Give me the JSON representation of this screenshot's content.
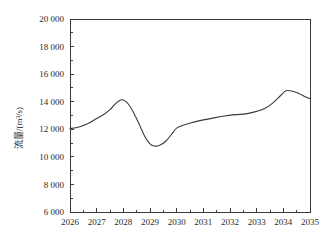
{
  "chart_data": {
    "type": "line",
    "title": "",
    "xlabel": "",
    "ylabel": "流量/(m³/s)",
    "xlim": [
      2026,
      2035
    ],
    "ylim": [
      6000,
      20000
    ],
    "grid": false,
    "legend": null,
    "x_tick_labels": [
      "2026",
      "2027",
      "2028",
      "2029",
      "2030",
      "2031",
      "2032",
      "2033",
      "2034",
      "2035"
    ],
    "x_ticks": [
      2026,
      2027,
      2028,
      2029,
      2030,
      2031,
      2032,
      2033,
      2034,
      2035
    ],
    "y_tick_labels": [
      "6 000",
      "8 000",
      "10 000",
      "12 000",
      "14 000",
      "16 000",
      "18 000",
      "20 000"
    ],
    "y_ticks": [
      6000,
      8000,
      10000,
      12000,
      14000,
      16000,
      18000,
      20000
    ],
    "y_minor_step": 1000,
    "x_minor_step": 0.5,
    "line_color": "#3a3a3a",
    "axis_color": "#3b3b3b",
    "background_color": "#ffffff",
    "series": [
      {
        "name": "流量",
        "x": [
          2026.0,
          2026.25,
          2026.5,
          2026.75,
          2027.0,
          2027.25,
          2027.5,
          2027.7,
          2027.9,
          2028.05,
          2028.2,
          2028.4,
          2028.6,
          2028.8,
          2029.0,
          2029.15,
          2029.35,
          2029.6,
          2029.8,
          2030.0,
          2030.3,
          2030.6,
          2031.0,
          2031.4,
          2031.8,
          2032.2,
          2032.6,
          2033.0,
          2033.3,
          2033.6,
          2033.9,
          2034.1,
          2034.35,
          2034.6,
          2034.8,
          2035.0
        ],
        "values": [
          12050,
          12130,
          12280,
          12500,
          12780,
          13050,
          13420,
          13850,
          14130,
          14080,
          13800,
          13150,
          12350,
          11500,
          10950,
          10790,
          10830,
          11150,
          11620,
          12080,
          12330,
          12500,
          12680,
          12830,
          12960,
          13060,
          13120,
          13300,
          13500,
          13900,
          14450,
          14800,
          14760,
          14580,
          14380,
          14220
        ]
      }
    ],
    "annotations": {
      "start_value": 12050,
      "first_peak": {
        "x": 2027.9,
        "y": 14130
      },
      "trough": {
        "x": 2029.15,
        "y": 10790
      },
      "second_peak": {
        "x": 2034.1,
        "y": 14800
      },
      "end_value": 14220
    }
  }
}
